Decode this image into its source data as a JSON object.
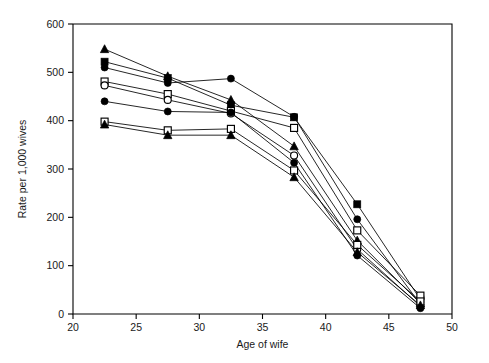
{
  "figure": {
    "background": "#ffffff",
    "ink_color": "#000000"
  },
  "chart_data": {
    "type": "line",
    "title": "",
    "xlabel": "Age of wife",
    "ylabel": "Rate per 1,000 wives",
    "xlim": [
      20,
      50
    ],
    "ylim": [
      0,
      600
    ],
    "xticks": [
      20,
      25,
      30,
      35,
      40,
      45,
      50
    ],
    "yticks": [
      0,
      100,
      200,
      300,
      400,
      500,
      600
    ],
    "xticklabels": [
      "20",
      "25",
      "30",
      "35",
      "40",
      "45",
      "50"
    ],
    "yticklabels": [
      "0",
      "100",
      "200",
      "300",
      "400",
      "500",
      "600"
    ],
    "grid": false,
    "legend": "none",
    "x": [
      22.5,
      27.5,
      32.5,
      37.5,
      42.5,
      47.5
    ],
    "series": [
      {
        "name": "series-1",
        "marker": "filled-triangle",
        "values": [
          548,
          492,
          443,
          347,
          152,
          22
        ]
      },
      {
        "name": "series-2",
        "marker": "filled-square",
        "values": [
          522,
          488,
          432,
          407,
          227,
          30
        ]
      },
      {
        "name": "series-3",
        "marker": "filled-circle",
        "values": [
          510,
          478,
          487,
          408,
          196,
          20
        ]
      },
      {
        "name": "series-4",
        "marker": "open-square",
        "values": [
          481,
          455,
          420,
          385,
          173,
          38
        ]
      },
      {
        "name": "series-5",
        "marker": "open-circle",
        "values": [
          473,
          443,
          415,
          328,
          134,
          16
        ]
      },
      {
        "name": "series-6",
        "marker": "filled-circle",
        "values": [
          440,
          419,
          417,
          313,
          121,
          12
        ]
      },
      {
        "name": "series-7",
        "marker": "open-square",
        "values": [
          398,
          380,
          383,
          297,
          143,
          26
        ]
      },
      {
        "name": "series-8",
        "marker": "filled-triangle",
        "values": [
          392,
          370,
          370,
          283,
          128,
          18
        ]
      }
    ]
  }
}
